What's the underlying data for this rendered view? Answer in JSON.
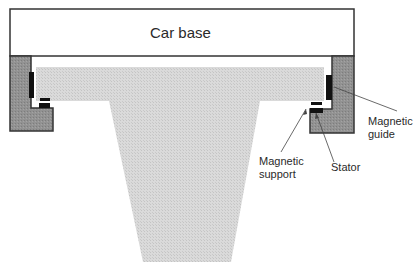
{
  "diagram": {
    "type": "cross-section",
    "colors": {
      "background": "#ffffff",
      "outline": "#333333",
      "wall_fill": "#8f8f8f",
      "rail_fill": "#d6d6d6",
      "magnet_fill": "#111111",
      "text": "#2a2a2a"
    },
    "labels": {
      "car_base": "Car base",
      "magnetic_guide_line1": "Magnetic",
      "magnetic_guide_line2": "guide",
      "magnetic_support_line1": "Magnetic",
      "magnetic_support_line2": "support",
      "stator": "Stator"
    },
    "components": [
      {
        "name": "car-base",
        "description": "Rectangular car base at top"
      },
      {
        "name": "left-bracket",
        "description": "L-shaped car-mounted bracket (left)"
      },
      {
        "name": "right-bracket",
        "description": "L-shaped car-mounted bracket (right)"
      },
      {
        "name": "guideway-rail",
        "description": "T-shaped stippled guideway rail"
      },
      {
        "name": "magnetic-guide",
        "description": "Vertical magnets on bracket inner face"
      },
      {
        "name": "magnetic-support",
        "description": "Magnets beneath rail flange"
      },
      {
        "name": "stator",
        "description": "Stator on lower bracket arm"
      }
    ]
  }
}
